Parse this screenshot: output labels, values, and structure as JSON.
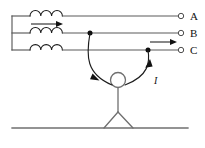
{
  "diagram": {
    "background_color": "#ffffff",
    "wire_color": "#5a5a5a",
    "ink_color": "#1a1a1a",
    "person_color": "#6f6f6f",
    "phases": [
      {
        "id": "phase-a",
        "label": "A",
        "y": 16,
        "terminal_x": 182,
        "label_x": 192,
        "label_y": 20,
        "has_coil": true,
        "coil_start_x": 30,
        "coil_end_x": 62,
        "coil_turns": 3,
        "has_source_arrow": true,
        "source_arrow_y": 24,
        "source_arrow_x1": 30,
        "source_arrow_x2": 62,
        "contact": false
      },
      {
        "id": "phase-b",
        "label": "B",
        "y": 33,
        "terminal_x": 182,
        "label_x": 192,
        "label_y": 37,
        "has_coil": true,
        "coil_start_x": 30,
        "coil_end_x": 62,
        "coil_turns": 3,
        "has_source_arrow": false,
        "contact": true,
        "contact_x": 90,
        "contact_y": 33
      },
      {
        "id": "phase-c",
        "label": "C",
        "y": 50,
        "terminal_x": 182,
        "label_x": 192,
        "label_y": 54,
        "has_coil": true,
        "coil_start_x": 30,
        "coil_end_x": 62,
        "coil_turns": 3,
        "has_source_arrow": false,
        "contact": true,
        "contact_x": 148,
        "contact_y": 50
      }
    ],
    "bus_bar": {
      "x": 12,
      "y_top": 16,
      "y_bottom": 50
    },
    "line_right_end": 182,
    "load_arrow": {
      "id": "load-current-arrow",
      "y": 42,
      "x1": 150,
      "x2": 178,
      "direction": "right"
    },
    "current_label": {
      "text": "I",
      "x": 155,
      "y": 83
    },
    "person": {
      "head_cx": 118,
      "head_cy": 80,
      "head_r": 7.5,
      "body_x": 118,
      "body_y_top": 87.5,
      "body_y_bottom": 112,
      "leg_left_x": 104,
      "leg_right_x": 133,
      "leg_y": 128,
      "left_arm": {
        "from_x": 90,
        "from_y": 33,
        "ctrl_x": 88,
        "ctrl_y": 72,
        "to_x": 112,
        "to_y": 84,
        "arrow_at_x": 96,
        "arrow_at_y": 78,
        "direction": "down"
      },
      "right_arm": {
        "from_x": 148,
        "from_y": 50,
        "ctrl_x": 146,
        "ctrl_y": 72,
        "to_x": 125,
        "to_y": 84,
        "arrow_at_x": 150,
        "arrow_at_y": 67,
        "direction": "up"
      }
    },
    "ground": {
      "y": 128,
      "x1": 12,
      "x2": 188
    },
    "annotations": {
      "phase_count": "3",
      "contact_points": "2",
      "coil_symbol": "inductor-coil",
      "figure_type": "electrical-schematic"
    }
  }
}
